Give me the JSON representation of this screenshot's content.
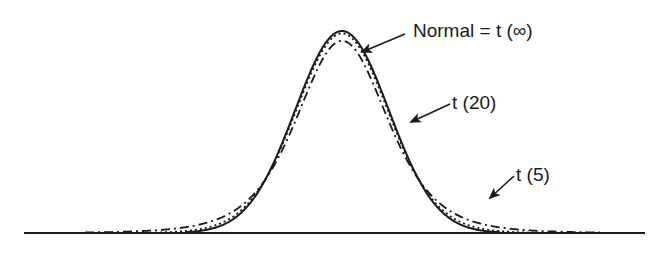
{
  "chart_data": {
    "type": "line",
    "title": "",
    "xlabel": "",
    "ylabel": "",
    "grid": false,
    "legend": "inline annotations with arrows",
    "series": [
      {
        "name": "Normal = t (∞)",
        "df": "infinity",
        "style": "solid",
        "relative_peak": 1.0
      },
      {
        "name": "t (20)",
        "df": 20,
        "style": "dotted",
        "relative_peak": 0.85
      },
      {
        "name": "t (5)",
        "df": 5,
        "style": "dash-dot",
        "relative_peak": 0.63
      }
    ],
    "annotations": [
      "Normal = t (∞)",
      "t (20)",
      "t (5)"
    ]
  },
  "labels": {
    "normal": "Normal = t (∞)",
    "t20": "t (20)",
    "t5": "t (5)"
  },
  "colors": {
    "ink": "#1a1a1a",
    "background": "#ffffff"
  }
}
